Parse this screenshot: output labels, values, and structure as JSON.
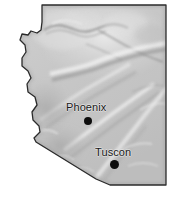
{
  "figure": {
    "kind": "relief-map",
    "region_name": "Arizona",
    "width_px": 175,
    "height_px": 203,
    "background_color": "#ffffff",
    "land_fill_color": "#c6c6c6",
    "land_fill_light": "#e6e6e6",
    "land_fill_dark": "#a2a2a2",
    "outline_color": "#2b2b2b",
    "marker_color": "#0d0d0d",
    "label_color": "#1a1a1a"
  },
  "cities": [
    {
      "name": "Phoenix",
      "label_x": 66,
      "label_y": 101,
      "dot_x": 88,
      "dot_y": 121,
      "dot_radius": 4
    },
    {
      "name": "Tuscon",
      "label_x": 95,
      "label_y": 146,
      "dot_x": 115,
      "dot_y": 165,
      "dot_radius": 4.5
    }
  ],
  "outline": {
    "description": "Arizona state boundary: straight north border, stair-step and wavy Colorado River western border, straight eastern border, diagonal southwest cut and straight southern border",
    "path": "M 42,5 L 166,5 L 166,185 L 110,185 L 96,179 L 36,142 L 34,138 L 40,132 L 39,126 L 33,120 L 32,112 L 37,105 L 35,97 L 28,92 L 27,84 L 31,78 L 28,71 L 22,66 L 22,58 L 26,52 L 25,45 L 20,40 L 22,34 L 28,35 L 31,31 L 37,33 L 41,30 L 42,22 Z"
  }
}
